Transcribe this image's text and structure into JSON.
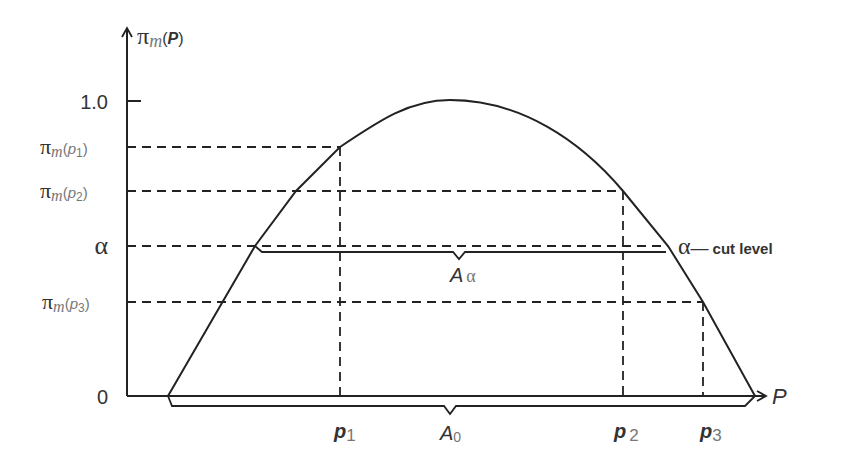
{
  "diagram": {
    "y_axis": {
      "label_main": "π",
      "label_sub": "m",
      "label_arg_open": "(",
      "label_arg": "P",
      "label_arg_close": ")",
      "ticks": {
        "one": "1.0",
        "zero": "0",
        "alpha": "α",
        "pi_p1": {
          "main": "π",
          "sub": "m",
          "open": "(",
          "arg": "p",
          "idx": "1",
          "close": ")"
        },
        "pi_p2": {
          "main": "π",
          "sub": "m",
          "open": "(",
          "arg": "p",
          "idx": "2",
          "close": ")"
        },
        "pi_p3": {
          "main": "π",
          "sub": "m",
          "open": "(",
          "arg": "p",
          "idx": "3",
          "close": ")"
        }
      }
    },
    "x_axis": {
      "label": "P",
      "points": {
        "p1": {
          "arg": "p",
          "idx": "1"
        },
        "p2": {
          "arg": "p",
          "idx": "2"
        },
        "p3": {
          "arg": "p",
          "idx": "3"
        }
      }
    },
    "annotations": {
      "alpha_cut": {
        "alpha": "α",
        "dash": "—",
        "text": "cut level"
      },
      "A_alpha": {
        "main": "A",
        "sub": "α"
      },
      "A_0": {
        "main": "A",
        "sub": "0"
      }
    },
    "colors": {
      "line": "#222222",
      "text": "#333333"
    }
  }
}
